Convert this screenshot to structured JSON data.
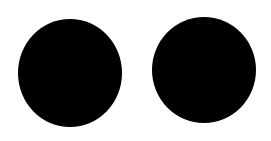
{
  "canvas": {
    "background": "#ffffff",
    "width": 271,
    "height": 141
  },
  "shapes": [
    {
      "type": "circle",
      "name": "left-dot",
      "color": "#000000"
    },
    {
      "type": "circle",
      "name": "right-dot",
      "color": "#000000"
    }
  ]
}
